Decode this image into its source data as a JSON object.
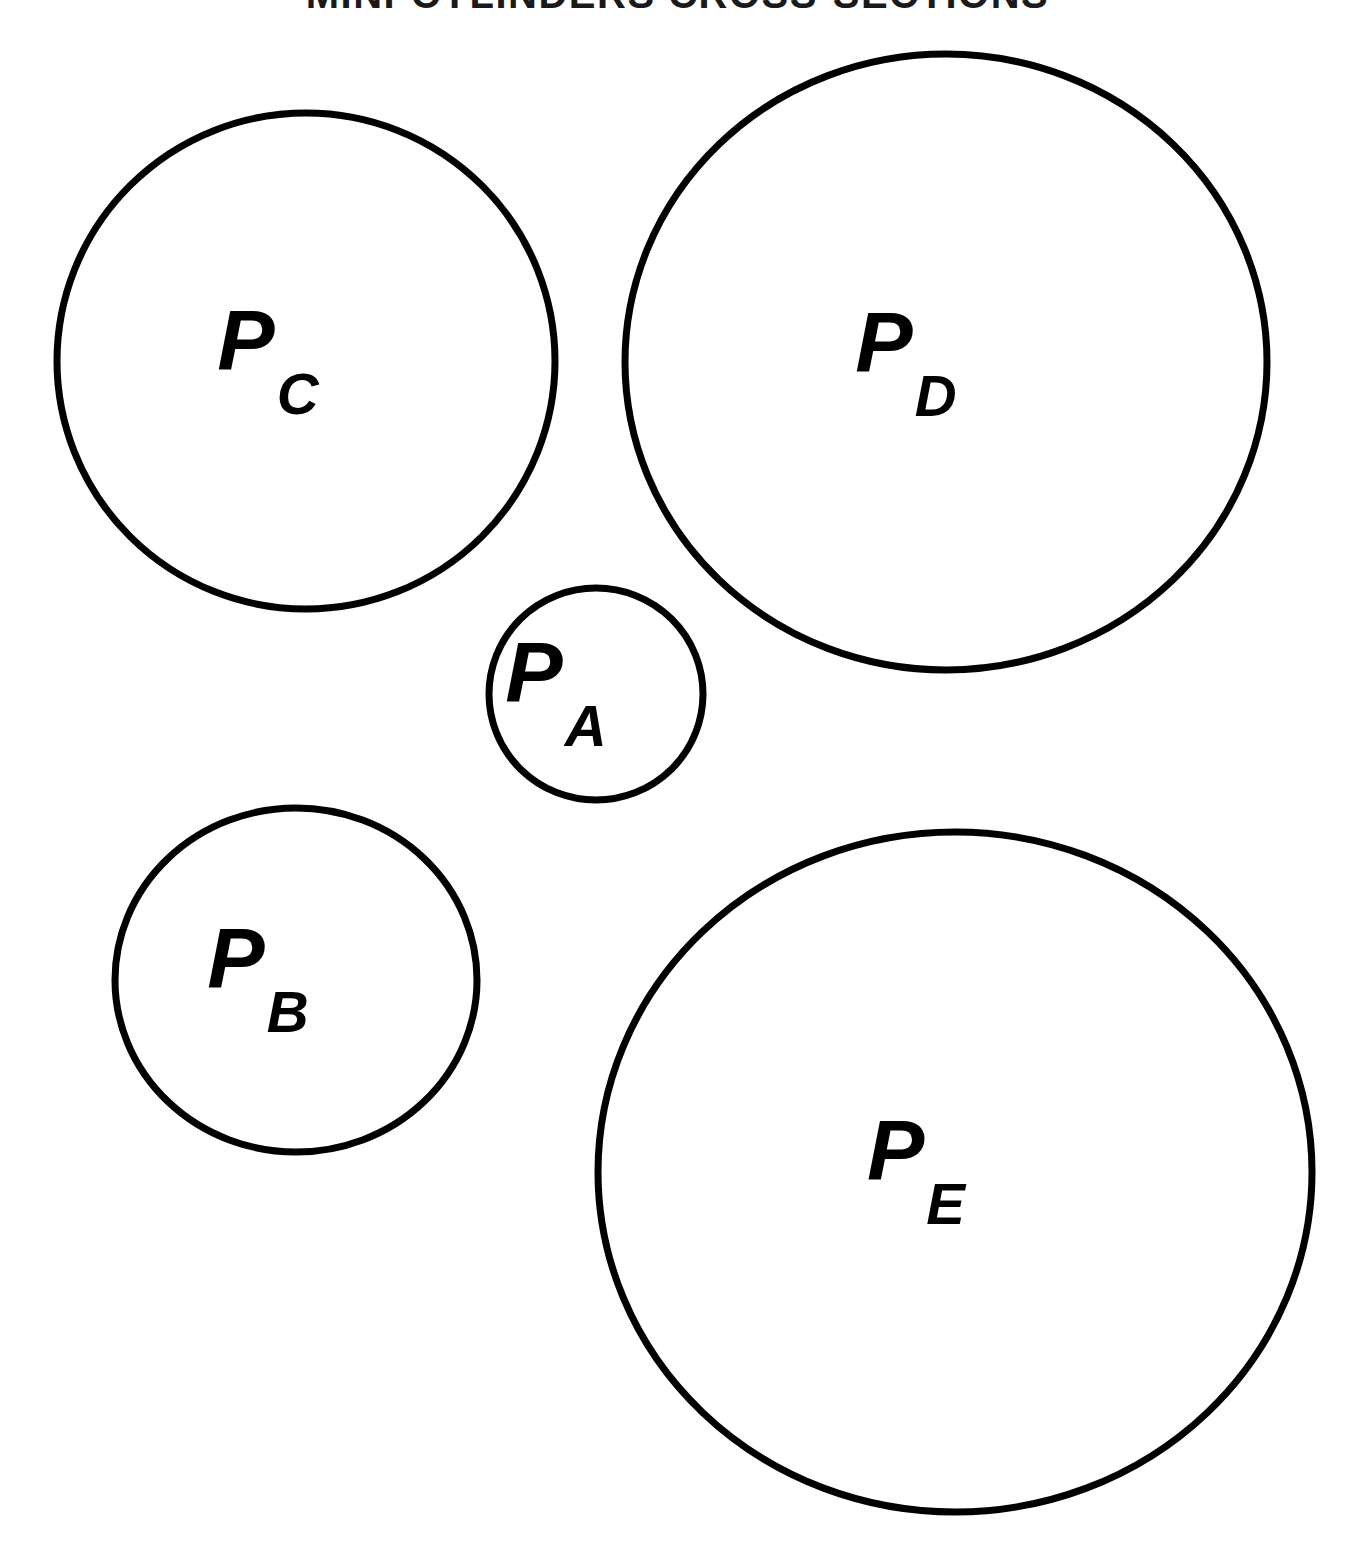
{
  "figure": {
    "title": "MINI-CYLINDERS CROSS-SECTIONS",
    "background_color": "#ffffff",
    "stroke_color": "#000000",
    "label_color": "#000000",
    "width": 1355,
    "height": 1563
  },
  "chart_data": {
    "type": "scatter",
    "title": "MINI-CYLINDERS CROSS-SECTIONS",
    "xlabel": "",
    "ylabel": "",
    "grid": false,
    "legend": "none",
    "note": "Five circles (cylinder cross-sections) drawn to scale; each labeled with an italic P and an italic subscript letter.",
    "series": [
      {
        "name": "cross-sections",
        "points": [
          {
            "label_base": "P",
            "label_sub": "A",
            "cx": 596,
            "cy": 694,
            "r": 107
          },
          {
            "label_base": "P",
            "label_sub": "B",
            "cx": 296,
            "cy": 980,
            "r": 181
          },
          {
            "label_base": "P",
            "label_sub": "C",
            "cx": 306,
            "cy": 361,
            "r": 249
          },
          {
            "label_base": "P",
            "label_sub": "D",
            "cx": 946,
            "cy": 362,
            "r": 320
          },
          {
            "label_base": "P",
            "label_sub": "E",
            "cx": 955,
            "cy": 1172,
            "r": 345
          }
        ]
      }
    ]
  },
  "circles": [
    {
      "id": "circle-pc",
      "name": "P_C",
      "label_base": "P",
      "label_sub": "C",
      "cx": 306,
      "cy": 361,
      "rx": 249,
      "ry": 248,
      "stroke_width": 7,
      "label_x": 268,
      "label_y": 370
    },
    {
      "id": "circle-pd",
      "name": "P_D",
      "label_base": "P",
      "label_sub": "D",
      "cx": 946,
      "cy": 362,
      "rx": 321,
      "ry": 308,
      "stroke_width": 7,
      "label_x": 906,
      "label_y": 372
    },
    {
      "id": "circle-pa",
      "name": "P_A",
      "label_base": "P",
      "label_sub": "A",
      "cx": 596,
      "cy": 694,
      "rx": 107,
      "ry": 106,
      "stroke_width": 7,
      "label_x": 556,
      "label_y": 702
    },
    {
      "id": "circle-pb",
      "name": "P_B",
      "label_base": "P",
      "label_sub": "B",
      "cx": 296,
      "cy": 980,
      "rx": 181,
      "ry": 172,
      "stroke_width": 7,
      "label_x": 258,
      "label_y": 988
    },
    {
      "id": "circle-pe",
      "name": "P_E",
      "label_base": "P",
      "label_sub": "E",
      "cx": 955,
      "cy": 1172,
      "rx": 357,
      "ry": 340,
      "stroke_width": 7,
      "label_x": 916,
      "label_y": 1180
    }
  ]
}
